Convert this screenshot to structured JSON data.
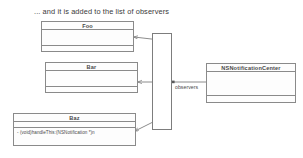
{
  "diagram": {
    "caption": "... and it is added to the list of observers",
    "classes": [
      {
        "id": "foo",
        "name": "Foo",
        "members": [],
        "x": 41,
        "y": 21,
        "w": 93,
        "h": 31
      },
      {
        "id": "bar",
        "name": "Bar",
        "members": [],
        "x": 45,
        "y": 62,
        "w": 93,
        "h": 31
      },
      {
        "id": "baz",
        "name": "Baz",
        "members": [
          "- (void)handleThis:(NSNotification *)n"
        ],
        "x": 13,
        "y": 113,
        "w": 123,
        "h": 33
      },
      {
        "id": "nsnotificationcenter",
        "name": "NSNotificationCenter",
        "members": [],
        "x": 206,
        "y": 63,
        "w": 90,
        "h": 40
      }
    ],
    "observers_list": {
      "label": "observers list",
      "x": 152,
      "y": 33,
      "w": 20,
      "h": 97
    },
    "edges": [
      {
        "id": "edge-foo",
        "label": "",
        "from": "observers-list",
        "to": "foo",
        "style": "arrow"
      },
      {
        "id": "edge-bar",
        "label": "",
        "from": "observers-list",
        "to": "bar",
        "style": "arrow"
      },
      {
        "id": "edge-baz",
        "label": "",
        "from": "observers-list",
        "to": "baz",
        "style": "arrow"
      },
      {
        "id": "edge-center",
        "label": "observers",
        "from": "nsnotificationcenter",
        "to": "observers-list",
        "style": "line"
      }
    ],
    "edge_label_observers": "observers",
    "colors": {
      "stroke": "#8a8a8a",
      "text": "#4a4a4a",
      "caption": "#3a3a3a",
      "background": "#ffffff",
      "box_fill": "#fdfdfd"
    }
  }
}
